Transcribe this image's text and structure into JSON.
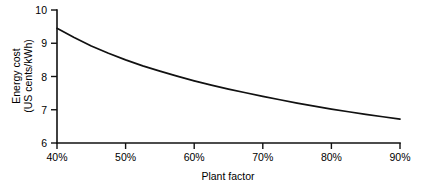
{
  "chart_data": {
    "type": "line",
    "title": "",
    "xlabel": "Plant factor",
    "ylabel": "Energy cost\n(US cents/kWh)",
    "ylabel_line1": "Energy cost",
    "ylabel_line2": "(US cents/kWh)",
    "xlim": [
      40,
      90
    ],
    "ylim": [
      6,
      10
    ],
    "grid": false,
    "legend": false,
    "xtick_labels": [
      "40%",
      "50%",
      "60%",
      "70%",
      "80%",
      "90%"
    ],
    "xtick_values": [
      40,
      50,
      60,
      70,
      80,
      90
    ],
    "ytick_labels": [
      "6",
      "7",
      "8",
      "9",
      "10"
    ],
    "ytick_values": [
      6,
      7,
      8,
      9,
      10
    ],
    "series": [
      {
        "name": "Energy cost vs plant factor",
        "color": "#111111",
        "x": [
          40,
          42.5,
          45,
          47.5,
          50,
          52.5,
          55,
          57.5,
          60,
          62.5,
          65,
          67.5,
          70,
          72.5,
          75,
          77.5,
          80,
          82.5,
          85,
          87.5,
          90
        ],
        "values": [
          9.45,
          9.17,
          8.92,
          8.7,
          8.5,
          8.32,
          8.16,
          8.01,
          7.87,
          7.74,
          7.62,
          7.51,
          7.4,
          7.3,
          7.2,
          7.11,
          7.02,
          6.94,
          6.86,
          6.79,
          6.72
        ]
      }
    ]
  },
  "colors": {
    "background": "#ffffff",
    "axis": "#111111",
    "curve": "#111111",
    "text": "#000000"
  }
}
